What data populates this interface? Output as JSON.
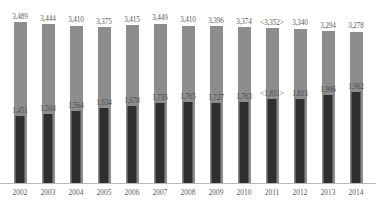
{
  "chart_data": {
    "type": "bar",
    "title": "",
    "subtitle": "",
    "xlabel": "",
    "ylabel": "",
    "grid": false,
    "legend": "none",
    "ylim": [
      0,
      3600
    ],
    "categories": [
      "2002",
      "2003",
      "2004",
      "2005",
      "2006",
      "2007",
      "2008",
      "2009",
      "2010",
      "2011",
      "2012",
      "2013",
      "2014"
    ],
    "series": [
      {
        "name": "total",
        "color": "#8d8d8d",
        "values": [
          3489,
          3444,
          3410,
          3375,
          3415,
          3449,
          3410,
          3396,
          3374,
          3352,
          3340,
          3294,
          3278
        ],
        "labels": [
          "3,489",
          "3,444",
          "3,410",
          "3,375",
          "3,415",
          "3,449",
          "3,410",
          "3,396",
          "3,374",
          "<3,352>",
          "3,340",
          "3,294",
          "3,278"
        ]
      },
      {
        "name": "subset",
        "color": "#2f2f2f",
        "values": [
          1451,
          1504,
          1564,
          1634,
          1678,
          1735,
          1765,
          1727,
          1763,
          1811,
          1813,
          1906,
          1962
        ],
        "labels": [
          "1,451",
          "1,504",
          "1,564",
          "1,634",
          "1,678",
          "1,735",
          "1,765",
          "1,727",
          "1,763",
          "<1,811>",
          "1,813",
          "1,906",
          "1,962"
        ]
      }
    ]
  }
}
